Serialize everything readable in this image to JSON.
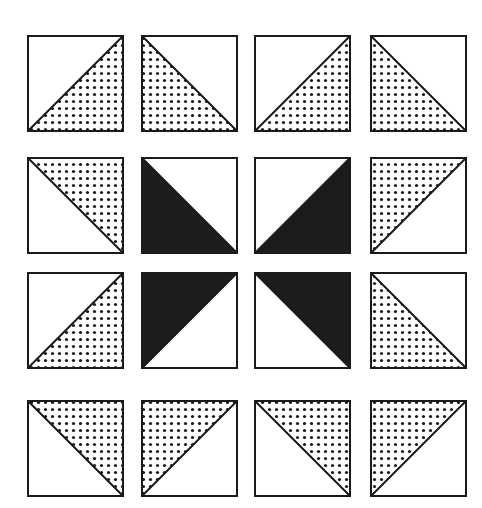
{
  "diagram": {
    "type": "quilt-block",
    "grid": {
      "rows": 4,
      "cols": 4
    },
    "colors": {
      "background": "#ffffff",
      "outline": "#1a1a1a",
      "solid": "#1c1c1c",
      "dot": "#1a1a1a"
    },
    "columns_x": [
      28,
      142,
      255,
      371
    ],
    "rows_y": [
      36,
      158,
      273,
      401
    ],
    "cell_size": 95,
    "legend": {
      "dotted": "dotted (stippled) half-square triangle",
      "solid": "solid black half-square triangle"
    },
    "cells": [
      [
        {
          "filled_corner": "bottom-right",
          "fill": "dotted"
        },
        {
          "filled_corner": "bottom-left",
          "fill": "dotted"
        },
        {
          "filled_corner": "bottom-right",
          "fill": "dotted"
        },
        {
          "filled_corner": "bottom-left",
          "fill": "dotted"
        }
      ],
      [
        {
          "filled_corner": "top-right",
          "fill": "dotted"
        },
        {
          "filled_corner": "bottom-left",
          "fill": "solid"
        },
        {
          "filled_corner": "bottom-right",
          "fill": "solid"
        },
        {
          "filled_corner": "top-left",
          "fill": "dotted"
        }
      ],
      [
        {
          "filled_corner": "bottom-right",
          "fill": "dotted"
        },
        {
          "filled_corner": "top-left",
          "fill": "solid"
        },
        {
          "filled_corner": "top-right",
          "fill": "solid"
        },
        {
          "filled_corner": "bottom-left",
          "fill": "dotted"
        }
      ],
      [
        {
          "filled_corner": "top-right",
          "fill": "dotted"
        },
        {
          "filled_corner": "top-left",
          "fill": "dotted"
        },
        {
          "filled_corner": "top-right",
          "fill": "dotted"
        },
        {
          "filled_corner": "top-left",
          "fill": "dotted"
        }
      ]
    ]
  }
}
